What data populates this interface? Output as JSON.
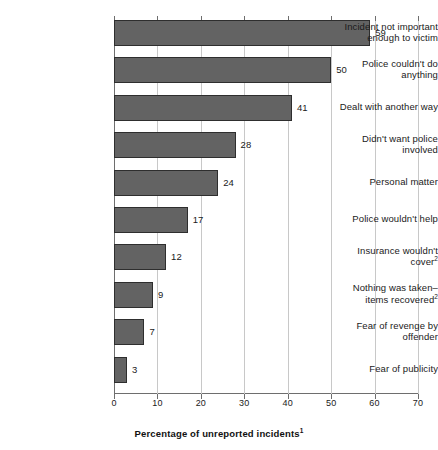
{
  "chart_data": {
    "type": "bar",
    "orientation": "horizontal",
    "title": "",
    "xlabel": "Percentage of unreported incidents",
    "xlabel_superscript": "1",
    "ylabel": "",
    "xlim": [
      0,
      70
    ],
    "xticks": [
      0,
      10,
      20,
      30,
      40,
      50,
      60,
      70
    ],
    "xtick_labels": [
      "0",
      "10",
      "20",
      "30",
      "40",
      "50",
      "60",
      "70"
    ],
    "grid": true,
    "legend": "none",
    "bar_color": "#636363",
    "bar_edge_color": "#2e2e2e",
    "gridline_color": "#c8c8c8",
    "axis_color": "#6e6e6e",
    "categories": [
      "Incident not important enough to victim",
      "Police couldn't do anything",
      "Dealt with another way",
      "Didn't want police involved",
      "Personal matter",
      "Police wouldn't help",
      "Insurance wouldn't cover",
      "Nothing was taken–items recovered",
      "Fear of revenge by offender",
      "Fear of publicity"
    ],
    "category_superscripts": [
      "",
      "",
      "",
      "",
      "",
      "",
      "2",
      "2",
      "",
      ""
    ],
    "category_lines": [
      [
        "Incident not important",
        "enough to victim"
      ],
      [
        "Police couldn't do",
        "anything"
      ],
      [
        "Dealt with another way"
      ],
      [
        "Didn't want police",
        "involved"
      ],
      [
        "Personal matter"
      ],
      [
        "Police wouldn't help"
      ],
      [
        "Insurance wouldn't",
        "cover"
      ],
      [
        "Nothing was taken–",
        "items recovered"
      ],
      [
        "Fear of revenge by",
        "offender"
      ],
      [
        "Fear of publicity"
      ]
    ],
    "values": [
      59,
      50,
      41,
      28,
      24,
      17,
      12,
      9,
      7,
      3
    ],
    "value_labels": [
      "59",
      "50",
      "41",
      "28",
      "24",
      "17",
      "12",
      "9",
      "7",
      "3"
    ]
  }
}
